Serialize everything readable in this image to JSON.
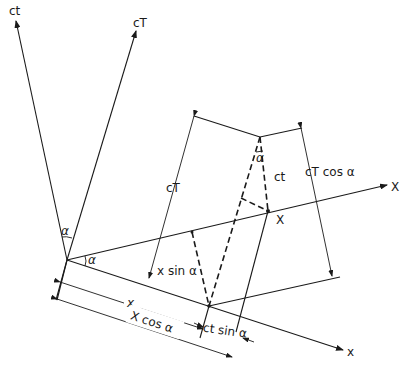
{
  "diagram": {
    "title": "",
    "axes": {
      "ct": {
        "label": "ct"
      },
      "cT": {
        "label": "cT"
      },
      "X": {
        "label": "X"
      },
      "x": {
        "label": "x"
      }
    },
    "labels": {
      "alpha_top": "α",
      "alpha_origin": "α",
      "alpha_event": "α",
      "cT_dim": "cT",
      "ct_segment": "ct",
      "cT_cos": "cT cos α",
      "event_point": "X",
      "x_sin": "x sin α",
      "x_dim": "x",
      "X_cos": "X cos α",
      "ct_sin": "ct sin α"
    },
    "colors": {
      "ink": "#1a1a1a",
      "background": "#ffffff"
    }
  }
}
